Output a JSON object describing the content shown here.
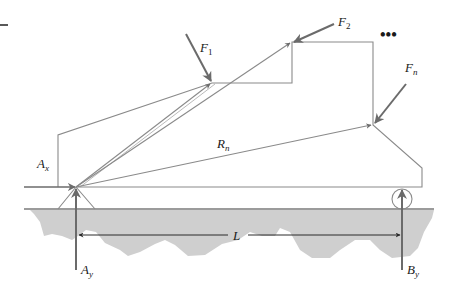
{
  "figure": {
    "type": "free-body diagram",
    "colors": {
      "outline": "#8a8a8a",
      "force_arrow": "#6b6b6b",
      "ground_fill": "#cfcfcf",
      "ground_line": "#7a7a7a",
      "text": "#1a1a1a",
      "dimension_line": "#3a3a3a"
    }
  },
  "labels": {
    "F1": {
      "main": "F",
      "sub": "1"
    },
    "F2": {
      "main": "F",
      "sub": "2"
    },
    "ellipsis": "•••",
    "Fn": {
      "main": "F",
      "sub": "n"
    },
    "Rn": {
      "main": "R",
      "sub": "n"
    },
    "Ax": {
      "main": "A",
      "sub": "x"
    },
    "Ay": {
      "main": "A",
      "sub": "y"
    },
    "By": {
      "main": "B",
      "sub": "y"
    },
    "L": "L"
  },
  "forces": [
    {
      "name": "F1",
      "applied_at": "upper-left corner of step"
    },
    {
      "name": "F2",
      "applied_at": "top-left corner of upper block"
    },
    {
      "name": "Fn",
      "applied_at": "right corner above chamfer"
    },
    {
      "name": "Ax",
      "applied_at": "pin support A",
      "direction": "horizontal"
    },
    {
      "name": "Ay",
      "applied_at": "pin support A",
      "direction": "vertical up"
    },
    {
      "name": "By",
      "applied_at": "roller support B",
      "direction": "vertical up"
    }
  ],
  "position_vectors": [
    "r1",
    "r2",
    "Rn"
  ],
  "dimension": {
    "label": "L",
    "from": "A",
    "to": "B"
  }
}
